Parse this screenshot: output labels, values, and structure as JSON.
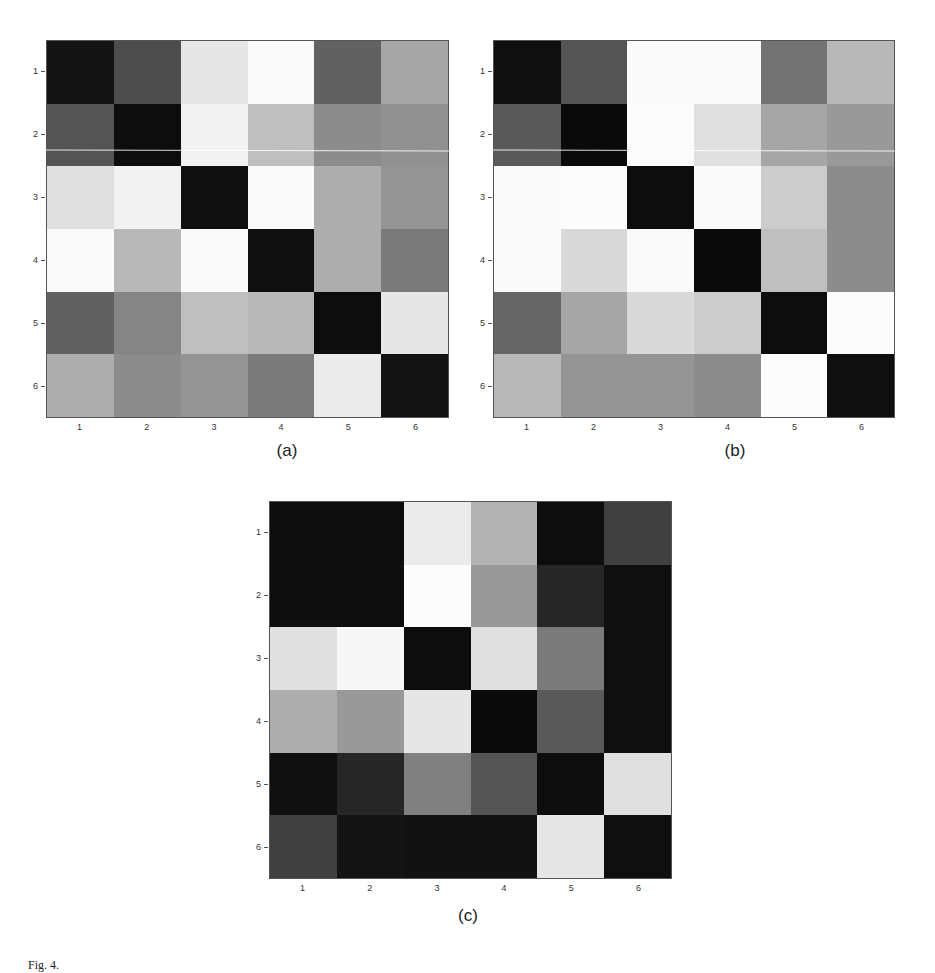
{
  "page": {
    "header_text": "",
    "caption_text": "Fig. 4."
  },
  "chart_data": [
    {
      "type": "heatmap",
      "id": "a",
      "title": "(a)",
      "xlabel": "",
      "ylabel": "",
      "x_ticks": [
        "1",
        "2",
        "3",
        "4",
        "5",
        "6"
      ],
      "y_ticks": [
        "1",
        "2",
        "3",
        "4",
        "5",
        "6"
      ],
      "colormap": "grayscale (0=black, 1=white)",
      "values": [
        [
          0.08,
          0.3,
          0.9,
          0.98,
          0.38,
          0.65
        ],
        [
          0.33,
          0.05,
          0.95,
          0.75,
          0.55,
          0.57
        ],
        [
          0.88,
          0.95,
          0.06,
          0.98,
          0.68,
          0.58
        ],
        [
          0.98,
          0.72,
          0.98,
          0.06,
          0.68,
          0.48
        ],
        [
          0.38,
          0.52,
          0.75,
          0.72,
          0.05,
          0.9
        ],
        [
          0.68,
          0.55,
          0.58,
          0.48,
          0.92,
          0.08
        ]
      ],
      "grid": false,
      "legend": "none"
    },
    {
      "type": "heatmap",
      "id": "b",
      "title": "(b)",
      "xlabel": "",
      "ylabel": "",
      "x_ticks": [
        "1",
        "2",
        "3",
        "4",
        "5",
        "6"
      ],
      "y_ticks": [
        "1",
        "2",
        "3",
        "4",
        "5",
        "6"
      ],
      "colormap": "grayscale (0=black, 1=white)",
      "values": [
        [
          0.06,
          0.33,
          0.98,
          0.98,
          0.45,
          0.72
        ],
        [
          0.35,
          0.04,
          0.99,
          0.88,
          0.65,
          0.6
        ],
        [
          0.98,
          0.99,
          0.05,
          0.98,
          0.8,
          0.55
        ],
        [
          0.98,
          0.85,
          0.98,
          0.04,
          0.75,
          0.55
        ],
        [
          0.4,
          0.65,
          0.85,
          0.8,
          0.05,
          0.99
        ],
        [
          0.72,
          0.58,
          0.58,
          0.55,
          0.99,
          0.06
        ]
      ],
      "grid": false,
      "legend": "none"
    },
    {
      "type": "heatmap",
      "id": "c",
      "title": "(c)",
      "xlabel": "",
      "ylabel": "",
      "x_ticks": [
        "1",
        "2",
        "3",
        "4",
        "5",
        "6"
      ],
      "y_ticks": [
        "1",
        "2",
        "3",
        "4",
        "5",
        "6"
      ],
      "colormap": "grayscale (0=black, 1=white)",
      "values": [
        [
          0.05,
          0.05,
          0.92,
          0.7,
          0.05,
          0.25
        ],
        [
          0.05,
          0.05,
          0.99,
          0.6,
          0.15,
          0.06
        ],
        [
          0.88,
          0.97,
          0.05,
          0.88,
          0.48,
          0.06
        ],
        [
          0.68,
          0.6,
          0.9,
          0.04,
          0.35,
          0.06
        ],
        [
          0.06,
          0.15,
          0.5,
          0.33,
          0.05,
          0.88
        ],
        [
          0.25,
          0.08,
          0.07,
          0.07,
          0.9,
          0.06
        ]
      ],
      "grid": false,
      "legend": "none"
    }
  ],
  "layout": {
    "plots": [
      {
        "left": 46,
        "top": 40,
        "width": 403,
        "height": 378,
        "label_x": 287,
        "label_y": 441
      },
      {
        "left": 493,
        "top": 40,
        "width": 402,
        "height": 378,
        "label_x": 735,
        "label_y": 441
      },
      {
        "left": 269,
        "top": 501,
        "width": 403,
        "height": 378,
        "label_x": 468,
        "label_y": 906
      }
    ]
  }
}
